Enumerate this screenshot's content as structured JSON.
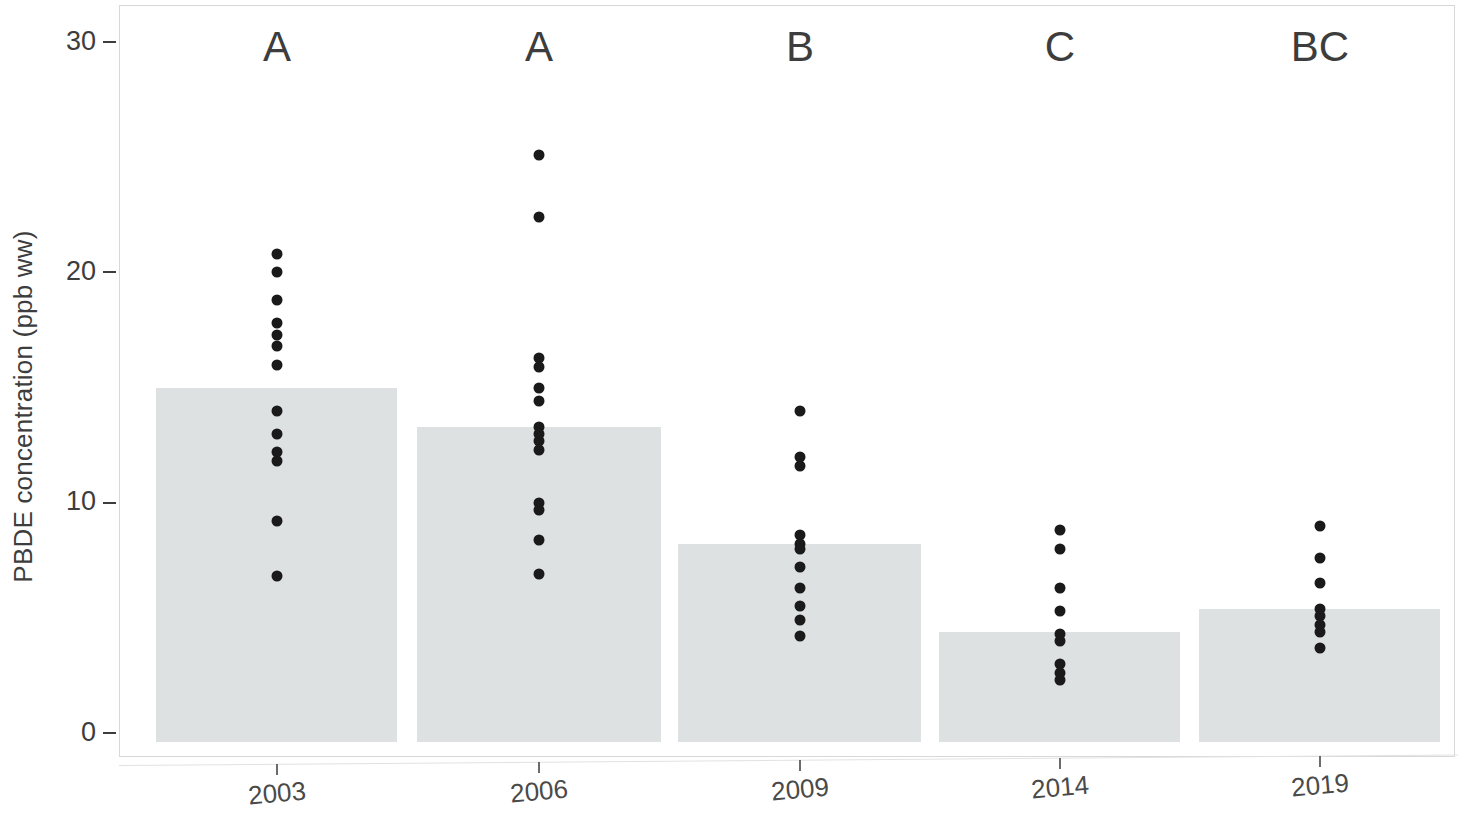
{
  "chart_data": {
    "type": "bar",
    "title": "",
    "subtitle": "",
    "xlabel": "",
    "ylabel": "PBDE concentration (ppb ww)",
    "categories": [
      "2003",
      "2006",
      "2009",
      "2014",
      "2019"
    ],
    "values": [
      15.0,
      13.3,
      8.2,
      4.4,
      5.4
    ],
    "ylim": [
      0,
      30
    ],
    "yticks": [
      0,
      10,
      20,
      30
    ],
    "ytick_labels": [
      "0",
      "10",
      "20",
      "30"
    ],
    "grid": false,
    "legend": "none",
    "bar_color": "#dee1e2",
    "point_color": "#1a1a1a",
    "annotations": {
      "label": "significance group letters above each bar",
      "values": [
        "A",
        "A",
        "B",
        "C",
        "BC"
      ]
    },
    "overlay_points": {
      "type": "scatter",
      "note": "individual sample values jittered on each year",
      "series": [
        {
          "name": "2003",
          "values": [
            20.8,
            20.0,
            18.8,
            17.8,
            17.3,
            16.8,
            16.0,
            14.0,
            13.0,
            12.2,
            11.8,
            9.2,
            6.8
          ]
        },
        {
          "name": "2006",
          "values": [
            25.1,
            22.4,
            16.3,
            15.9,
            15.0,
            14.4,
            13.3,
            13.0,
            12.7,
            12.3,
            10.0,
            9.7,
            8.4,
            6.9
          ]
        },
        {
          "name": "2009",
          "values": [
            14.0,
            12.0,
            11.6,
            8.6,
            8.2,
            8.0,
            7.2,
            6.3,
            5.5,
            4.9,
            4.2
          ]
        },
        {
          "name": "2014",
          "values": [
            8.8,
            8.0,
            6.3,
            5.3,
            4.3,
            4.0,
            3.0,
            2.6,
            2.3
          ]
        },
        {
          "name": "2019",
          "values": [
            9.0,
            7.6,
            6.5,
            5.4,
            5.1,
            4.7,
            4.4,
            3.7
          ]
        }
      ]
    }
  },
  "axis_geometry": {
    "y_zero_px": 733,
    "y_unit_px": 23.03,
    "bars_px": [
      {
        "left": 156,
        "right": 397,
        "center": 277
      },
      {
        "left": 417,
        "right": 661,
        "center": 539
      },
      {
        "left": 678,
        "right": 921,
        "center": 800
      },
      {
        "left": 939,
        "right": 1180,
        "center": 1060
      },
      {
        "left": 1199,
        "right": 1440,
        "center": 1320
      }
    ]
  }
}
